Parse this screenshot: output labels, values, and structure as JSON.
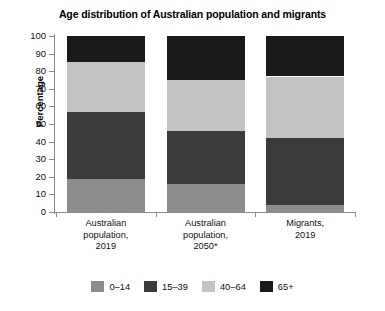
{
  "chart_data": {
    "type": "bar",
    "subtype": "stacked-bar-100",
    "title": "Age distribution of Australian population and migrants",
    "xlabel": "",
    "ylabel": "Percentage",
    "ylim": [
      0,
      100
    ],
    "ytick_step": 10,
    "yticks": [
      "100",
      "90",
      "80",
      "70",
      "60",
      "50",
      "40",
      "30",
      "20",
      "10",
      "0"
    ],
    "grid": false,
    "legend_position": "bottom",
    "categories": [
      "Australian population, 2019",
      "Australian population, 2050*",
      "Migrants, 2019"
    ],
    "category_lines": [
      [
        "Australian",
        "population,",
        "2019"
      ],
      [
        "Australian",
        "population,",
        "2050*"
      ],
      [
        "Migrants,",
        "2019"
      ]
    ],
    "series": [
      {
        "name": "0–14",
        "color": "#8c8c8c",
        "values": [
          19,
          16,
          4
        ]
      },
      {
        "name": "15–39",
        "color": "#3b3b3b",
        "values": [
          38,
          30,
          38
        ]
      },
      {
        "name": "40–64",
        "color": "#c3c3c3",
        "values": [
          28,
          29,
          35
        ]
      },
      {
        "name": "65+",
        "color": "#1a1a1a",
        "values": [
          15,
          25,
          23
        ]
      }
    ]
  },
  "colors": {
    "axis": "#8a8a8a",
    "text": "#111111",
    "background": "#ffffff"
  }
}
